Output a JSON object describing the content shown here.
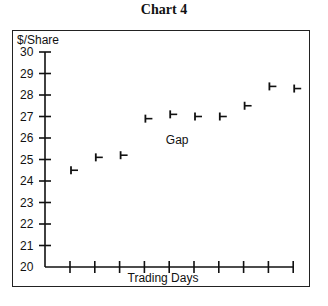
{
  "title": "Chart 4",
  "chart_data": {
    "type": "scatter",
    "marker": "close-tick (vertical bar with right tick)",
    "title": "Chart 4",
    "xlabel": "Trading Days",
    "ylabel": "$/Share",
    "ylim": [
      20,
      30
    ],
    "yticks": [
      20,
      21,
      22,
      23,
      24,
      25,
      26,
      27,
      28,
      29,
      30
    ],
    "x": [
      1,
      2,
      3,
      4,
      5,
      6,
      7,
      8,
      9,
      10
    ],
    "values": [
      24.5,
      25.1,
      25.2,
      26.9,
      27.1,
      27.0,
      27.0,
      27.5,
      28.4,
      28.3
    ],
    "annotations": [
      {
        "text": "Gap",
        "x": 4.5,
        "y": 25.7
      }
    ],
    "grid": false,
    "legend": null
  }
}
